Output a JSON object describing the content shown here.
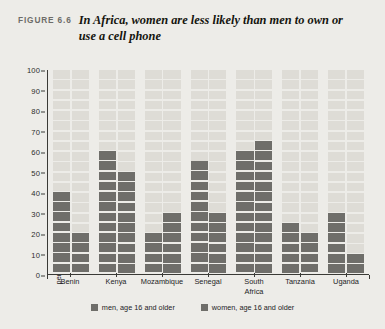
{
  "figure": {
    "label": "FIGURE 6.6",
    "title": "In Africa, women are less likely than men to own or use a cell phone"
  },
  "chart_data": {
    "type": "bar",
    "title": "In Africa, women are less likely than men to own or use a cell phone",
    "xlabel": "",
    "ylabel": "percentage of population owning/ using a cell phone",
    "ylabel_lines": [
      "percentage of population owning/",
      "using a cell phone"
    ],
    "ylim": [
      0,
      100
    ],
    "yticks": [
      0,
      10,
      20,
      30,
      40,
      50,
      60,
      70,
      80,
      90,
      100
    ],
    "grid": true,
    "legend_position": "bottom",
    "categories": [
      "Benin",
      "Kenya",
      "Mozambique",
      "Senegal",
      "South Africa",
      "Tanzania",
      "Uganda"
    ],
    "category_lines": [
      [
        "Benin"
      ],
      [
        "Kenya"
      ],
      [
        "Mozambique"
      ],
      [
        "Senegal"
      ],
      [
        "South",
        "Africa"
      ],
      [
        "Tanzania"
      ],
      [
        "Uganda"
      ]
    ],
    "series": [
      {
        "name": "men, age 16 and older",
        "color": "#6f6e6a",
        "values": [
          40,
          60,
          20,
          55,
          60,
          25,
          30
        ]
      },
      {
        "name": "women, age 16 and older",
        "color": "#6f6e6a",
        "values": [
          20,
          50,
          30,
          30,
          65,
          20,
          10
        ]
      }
    ]
  },
  "legend": {
    "items": [
      {
        "label": "men, age 16 and older"
      },
      {
        "label": "women, age 16 and older"
      }
    ]
  }
}
